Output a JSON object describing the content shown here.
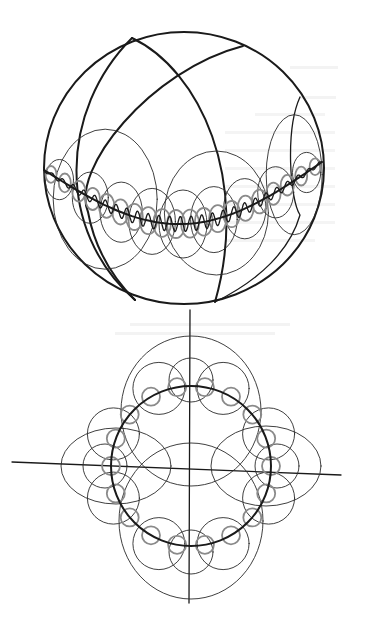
{
  "figure": {
    "title": "",
    "ink_color": "#1a1a1a",
    "secondary_ink_color": "#8a8a8a",
    "background": "#ffffff"
  },
  "sphere_view": {
    "center": [
      184,
      168
    ],
    "radius_x": 140,
    "radius_y": 136,
    "meridians": 3,
    "equator_wave_cycles": 26,
    "loop_levels": [
      "large loops",
      "medium loops",
      "small loops",
      "fine wave"
    ]
  },
  "cross_section_view": {
    "center": [
      191,
      466
    ],
    "main_circle_radius": 80,
    "vertical_axis": {
      "from": [
        190,
        310
      ],
      "to": [
        189,
        603
      ]
    },
    "horizontal_axis": {
      "from": [
        12,
        462
      ],
      "to": [
        341,
        475
      ]
    },
    "large_loops": 4,
    "medium_loops": 8,
    "small_loops": 18
  }
}
